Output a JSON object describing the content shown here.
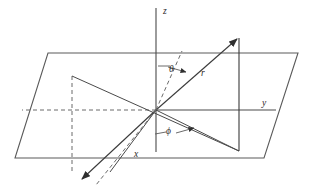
{
  "figure": {
    "background_color": "#ffffff",
    "stroke_color": "#4a4a4a",
    "label_color": "#2b2b2b"
  },
  "labels": {
    "z_axis": "z",
    "y_axis": "y",
    "x_axis": "x",
    "radius": "r",
    "polar_angle": "θ",
    "azimuthal_angle": "ϕ"
  },
  "geometry": {
    "origin": {
      "x": 156,
      "y": 110
    },
    "z_axis_top": {
      "x": 156,
      "y": 8
    },
    "y_axis_right_end": {
      "x": 272,
      "y": 110
    },
    "x_axis_arrow_tip": {
      "x": 80,
      "y": 181
    },
    "r_arrow_tip": {
      "x": 239,
      "y": 36
    },
    "plane_corners": [
      {
        "x": 48,
        "y": 53
      },
      {
        "x": 298,
        "y": 53
      },
      {
        "x": 264,
        "y": 158
      },
      {
        "x": 15,
        "y": 158
      }
    ],
    "projection_point": {
      "x": 239,
      "y": 151
    },
    "projection_corner_left": {
      "x": 72,
      "y": 76
    },
    "dashed_vertical_x": 72,
    "dashed_horizontal_y": 110
  },
  "elements": {
    "z_axis_name": "z-axis vertical line",
    "y_axis_name": "y-axis horizontal line",
    "x_axis_name": "x-axis arrow toward viewer",
    "plane_name": "xy-plane parallelogram",
    "r_vector_name": "radial vector r",
    "theta_arc_name": "polar angle theta indicator",
    "phi_arc_name": "azimuthal angle phi indicator"
  }
}
